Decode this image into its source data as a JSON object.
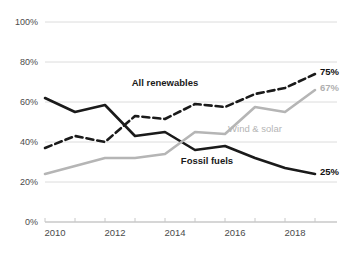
{
  "chart_data": {
    "type": "line",
    "title": "",
    "subtitle": "",
    "xlabel": "",
    "ylabel": "",
    "x": [
      2010,
      2011,
      2012,
      2013,
      2014,
      2015,
      2016,
      2017,
      2018,
      2019
    ],
    "xlim": [
      2010,
      2019
    ],
    "ylim": [
      0,
      100
    ],
    "grid": true,
    "legend_position": "inline-annotations",
    "y_ticks": [
      "0%",
      "20%",
      "40%",
      "60%",
      "80%",
      "100%"
    ],
    "y_tick_values": [
      0,
      20,
      40,
      60,
      80,
      100
    ],
    "x_ticks": [
      "2010",
      "2012",
      "2014",
      "2016",
      "2018"
    ],
    "x_tick_values": [
      2010,
      2012,
      2014,
      2016,
      2018
    ],
    "x_minor_ticks": [
      2011,
      2013,
      2015,
      2017,
      2019
    ],
    "series": [
      {
        "name": "Fossil fuels",
        "style": "solid",
        "color": "#1a1a1a",
        "values": [
          62,
          55,
          58.5,
          43,
          45,
          36,
          38,
          32,
          27,
          24
        ],
        "end_label": "25%",
        "end_label_color": "#111111",
        "annotation": "Fossil fuels"
      },
      {
        "name": "All renewables",
        "style": "dashed",
        "color": "#1a1a1a",
        "values": [
          37,
          43,
          40,
          53,
          51.5,
          59,
          57.5,
          64,
          67,
          74
        ],
        "end_label": "75%",
        "end_label_color": "#111111",
        "annotation": "All renewables"
      },
      {
        "name": "Wind & solar",
        "style": "solid",
        "color": "#b5b5b5",
        "values": [
          24,
          28,
          32,
          32,
          34,
          45,
          44,
          57.5,
          55,
          66
        ],
        "end_label": "67%",
        "end_label_color": "#b0b0b0",
        "annotation": "Wind & solar"
      }
    ],
    "annotations": [
      {
        "text": "All renewables",
        "x": 2014.0,
        "y": 68,
        "color": "#1a1a1a"
      },
      {
        "text": "Wind & solar",
        "x": 2017.0,
        "y": 45,
        "color": "#b5b5b5"
      },
      {
        "text": "Fossil fuels",
        "x": 2015.4,
        "y": 29,
        "color": "#1a1a1a"
      }
    ],
    "end_labels": [
      {
        "text": "75%",
        "value": 75,
        "color": "#111111",
        "series": "All renewables"
      },
      {
        "text": "67%",
        "value": 67,
        "color": "#b0b0b0",
        "series": "Wind & solar"
      },
      {
        "text": "25%",
        "value": 25,
        "color": "#111111",
        "series": "Fossil fuels"
      }
    ],
    "colors": {
      "fossil_fuels": "#1a1a1a",
      "all_renewables": "#1a1a1a",
      "wind_solar": "#b5b5b5",
      "gridline": "#dcdcdc",
      "axis": "#c8c8c8",
      "tick_text": "#4b4b4b",
      "background": "#ffffff"
    }
  },
  "footnote": {
    "text": ""
  }
}
